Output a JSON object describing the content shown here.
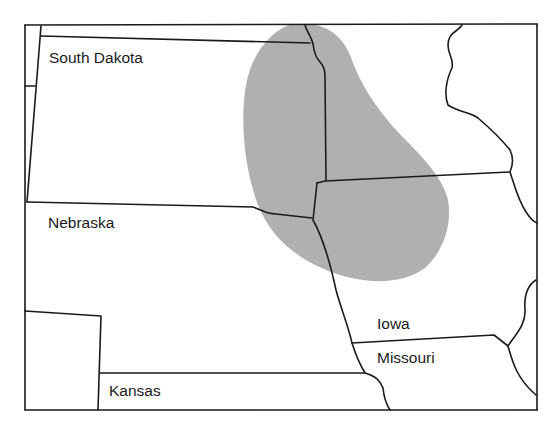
{
  "map": {
    "colors": {
      "background": "#ffffff",
      "border": "#1a1a1a",
      "shaded_region": "#b0b0b0"
    },
    "labels": [
      {
        "name": "South Dakota",
        "x": 49,
        "y": 50
      },
      {
        "name": "Nebraska",
        "x": 48,
        "y": 215
      },
      {
        "name": "Iowa",
        "x": 377,
        "y": 316
      },
      {
        "name": "Missouri",
        "x": 377,
        "y": 350
      },
      {
        "name": "Kansas",
        "x": 109,
        "y": 383
      }
    ],
    "shaded_region_label": "distribution-area"
  }
}
